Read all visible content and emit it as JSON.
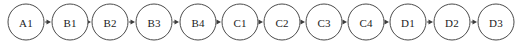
{
  "diagram": {
    "type": "linear-chain",
    "orientation": "horizontal-left-to-right",
    "title": "",
    "background_color": "#ffffff",
    "node_shape": "circle",
    "node_fill": "#ffffff",
    "node_stroke_color": "#4a4a4a",
    "node_radius": 18,
    "node_spacing": 44,
    "center_y": 22,
    "first_center_x": 26,
    "edge_color": "#4a4a4a",
    "edge_arrowhead": "filled-triangle",
    "label_color": "#1c1c1c",
    "nodes": [
      {
        "id": "A1",
        "label": "A1",
        "cx": 26
      },
      {
        "id": "B1",
        "label": "B1",
        "cx": 70
      },
      {
        "id": "B2",
        "label": "B2",
        "cx": 110
      },
      {
        "id": "B3",
        "label": "B3",
        "cx": 154
      },
      {
        "id": "B4",
        "label": "B4",
        "cx": 198
      },
      {
        "id": "C1",
        "label": "C1",
        "cx": 240
      },
      {
        "id": "C2",
        "label": "C2",
        "cx": 282
      },
      {
        "id": "C3",
        "label": "C3",
        "cx": 324
      },
      {
        "id": "C4",
        "label": "C4",
        "cx": 366
      },
      {
        "id": "D1",
        "label": "D1",
        "cx": 408
      },
      {
        "id": "D2",
        "label": "D2",
        "cx": 452
      },
      {
        "id": "D3",
        "label": "D3",
        "cx": 496
      }
    ],
    "edges": [
      {
        "from": "A1",
        "to": "B1"
      },
      {
        "from": "B1",
        "to": "B2"
      },
      {
        "from": "B2",
        "to": "B3"
      },
      {
        "from": "B3",
        "to": "B4"
      },
      {
        "from": "B4",
        "to": "C1"
      },
      {
        "from": "C1",
        "to": "C2"
      },
      {
        "from": "C2",
        "to": "C3"
      },
      {
        "from": "C3",
        "to": "C4"
      },
      {
        "from": "C4",
        "to": "D1"
      },
      {
        "from": "D1",
        "to": "D2"
      },
      {
        "from": "D2",
        "to": "D3"
      }
    ]
  }
}
